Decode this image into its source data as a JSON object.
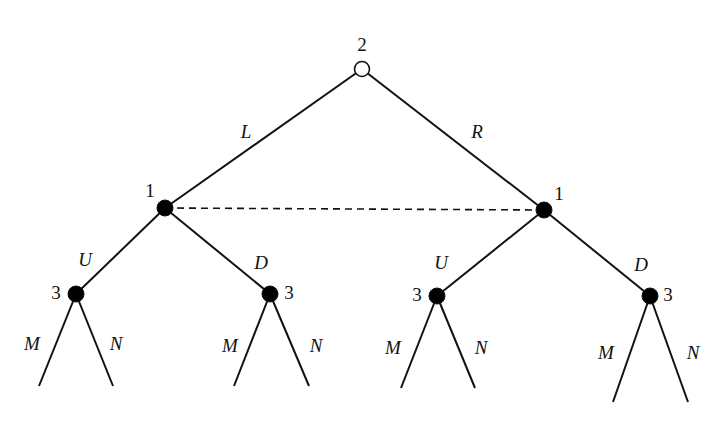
{
  "diagram": {
    "type": "extensive-form game tree",
    "colors": {
      "line": "#111111",
      "node_fill": "#000000",
      "root_fill": "#ffffff",
      "background": "#ffffff"
    },
    "nodes": [
      {
        "id": "root",
        "player": "2",
        "x": 362,
        "y": 69,
        "filled": false,
        "label_x": 362,
        "label_y": 44
      },
      {
        "id": "n1L",
        "player": "1",
        "x": 165,
        "y": 208,
        "filled": true,
        "label_x": 150,
        "label_y": 190
      },
      {
        "id": "n1R",
        "player": "1",
        "x": 544,
        "y": 210,
        "filled": true,
        "label_x": 559,
        "label_y": 193
      },
      {
        "id": "n3LU",
        "player": "3",
        "x": 76,
        "y": 294,
        "filled": true,
        "label_x": 56,
        "label_y": 292
      },
      {
        "id": "n3LD",
        "player": "3",
        "x": 270,
        "y": 294,
        "filled": true,
        "label_x": 289,
        "label_y": 292
      },
      {
        "id": "n3RU",
        "player": "3",
        "x": 437,
        "y": 296,
        "filled": true,
        "label_x": 417,
        "label_y": 294
      },
      {
        "id": "n3RD",
        "player": "3",
        "x": 650,
        "y": 296,
        "filled": true,
        "label_x": 668,
        "label_y": 294
      }
    ],
    "edges": [
      {
        "from": "root",
        "to": "n1L",
        "action": "L",
        "label_x": 246,
        "label_y": 131
      },
      {
        "from": "root",
        "to": "n1R",
        "action": "R",
        "label_x": 477,
        "label_y": 131
      },
      {
        "from": "n1L",
        "to": "n3LU",
        "action": "U",
        "label_x": 85,
        "label_y": 259
      },
      {
        "from": "n1L",
        "to": "n3LD",
        "action": "D",
        "label_x": 261,
        "label_y": 262
      },
      {
        "from": "n1R",
        "to": "n3RU",
        "action": "U",
        "label_x": 441,
        "label_y": 262
      },
      {
        "from": "n1R",
        "to": "n3RD",
        "action": "D",
        "label_x": 641,
        "label_y": 264
      }
    ],
    "leaves": [
      {
        "from": "n3LU",
        "x": 39,
        "y": 386,
        "action": "M",
        "label_x": 32,
        "label_y": 343
      },
      {
        "from": "n3LU",
        "x": 113,
        "y": 386,
        "action": "N",
        "label_x": 116,
        "label_y": 343
      },
      {
        "from": "n3LD",
        "x": 234,
        "y": 386,
        "action": "M",
        "label_x": 230,
        "label_y": 345
      },
      {
        "from": "n3LD",
        "x": 309,
        "y": 386,
        "action": "N",
        "label_x": 316,
        "label_y": 345
      },
      {
        "from": "n3RU",
        "x": 401,
        "y": 388,
        "action": "M",
        "label_x": 393,
        "label_y": 347
      },
      {
        "from": "n3RU",
        "x": 475,
        "y": 388,
        "action": "N",
        "label_x": 481,
        "label_y": 347
      },
      {
        "from": "n3RD",
        "x": 613,
        "y": 402,
        "action": "M",
        "label_x": 606,
        "label_y": 352
      },
      {
        "from": "n3RD",
        "x": 688,
        "y": 402,
        "action": "N",
        "label_x": 693,
        "label_y": 352
      }
    ],
    "information_sets": [
      {
        "player": "1",
        "members": [
          "n1L",
          "n1R"
        ],
        "style": "dashed"
      }
    ]
  }
}
